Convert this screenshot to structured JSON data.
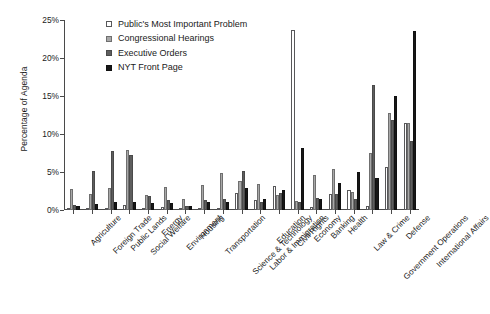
{
  "chart_data": {
    "type": "bar",
    "title": "",
    "xlabel": "",
    "ylabel": "Percentage of Agenda",
    "ylim": [
      0,
      25
    ],
    "yticks": [
      0,
      5,
      10,
      15,
      20,
      25
    ],
    "ytick_labels": [
      "0%",
      "5%",
      "10%",
      "15%",
      "20%",
      "25%"
    ],
    "grid": false,
    "legend_position": "top-left",
    "categories": [
      "Agriculture",
      "Foreign Trade",
      "Public Lands",
      "Social Welfare",
      "Energy",
      "Environment",
      "Housing",
      "Transportation",
      "Science & Technology",
      "Labor & Immigration",
      "Education",
      "Civil Rights",
      "Economy",
      "Banking",
      "Health",
      "Law & Crime",
      "Government Operations",
      "Defense",
      "International Affairs"
    ],
    "series": [
      {
        "name": "Public's Most Important Problem",
        "color": "#ffffff",
        "values": [
          0.1,
          0.2,
          0.1,
          0.7,
          0.2,
          0.4,
          0.3,
          0.1,
          0.1,
          2.3,
          1.3,
          3.1,
          23.7,
          0.4,
          2.1,
          2.6,
          0.5,
          5.6,
          11.5
        ]
      },
      {
        "name": "Congressional Hearings",
        "color": "#a8a8a8",
        "values": [
          2.8,
          2.1,
          2.9,
          7.9,
          2.0,
          3.0,
          1.4,
          3.3,
          4.9,
          3.8,
          3.4,
          2.0,
          1.2,
          4.6,
          5.4,
          2.4,
          7.5,
          12.8,
          11.5
        ]
      },
      {
        "name": "Executive Orders",
        "color": "#5e5e5e",
        "values": [
          0.7,
          5.1,
          7.8,
          7.2,
          1.8,
          1.3,
          0.5,
          1.3,
          1.5,
          5.1,
          1.0,
          2.3,
          1.1,
          1.6,
          2.1,
          1.5,
          16.4,
          11.8,
          9.1
        ]
      },
      {
        "name": "NYT Front Page",
        "color": "#171717",
        "values": [
          0.5,
          0.8,
          1.0,
          1.0,
          0.9,
          0.9,
          0.5,
          1.1,
          1.1,
          2.9,
          1.4,
          2.6,
          8.2,
          1.5,
          3.5,
          5.0,
          4.2,
          15.0,
          23.6
        ]
      }
    ]
  },
  "legend": {
    "items": [
      {
        "label": "Public's Most Important Problem"
      },
      {
        "label": "Congressional Hearings"
      },
      {
        "label": "Executive Orders"
      },
      {
        "label": "NYT Front Page"
      }
    ]
  }
}
